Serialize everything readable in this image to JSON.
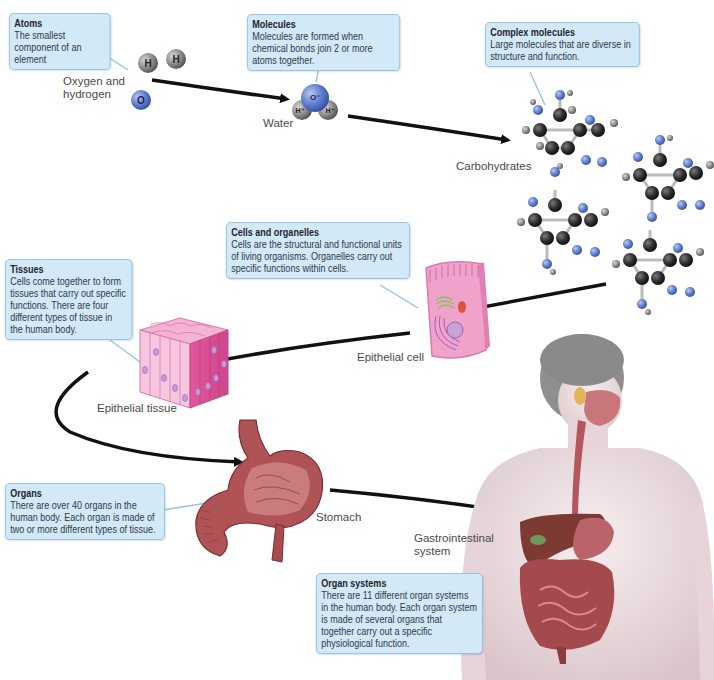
{
  "diagram": {
    "levels": [
      {
        "id": "atoms",
        "callout_title": "Atoms",
        "callout_body": "The smallest component of an element",
        "label": "Oxygen and hydrogen",
        "label_lines": [
          "Oxygen and",
          "hydrogen"
        ],
        "atom_symbols": [
          "H",
          "H",
          "O"
        ]
      },
      {
        "id": "molecules",
        "callout_title": "Molecules",
        "callout_body": "Molecules are formed when chemical bonds join 2 or more atoms together.",
        "label": "Water",
        "atom_symbols": [
          "O⁻",
          "H⁺",
          "H⁺"
        ]
      },
      {
        "id": "complex-molecules",
        "callout_title": "Complex molecules",
        "callout_body": "Large molecules that are diverse in structure and function.",
        "label": "Carbohydrates",
        "atom_symbols": [
          "C",
          "O",
          "H"
        ]
      },
      {
        "id": "cells",
        "callout_title": "Cells and organelles",
        "callout_body": "Cells are the structural and functional units of living organisms. Organelles carry out specific functions within cells.",
        "label": "Epithelial cell"
      },
      {
        "id": "tissues",
        "callout_title": "Tissues",
        "callout_body": "Cells come together to form tissues that carry out specific functions. There are four different types of tissue in the human body.",
        "label": "Epithelial tissue"
      },
      {
        "id": "organs",
        "callout_title": "Organs",
        "callout_body": "There are over 40 organs in the human body. Each organ is made of two or more different types of tissue.",
        "label": "Stomach"
      },
      {
        "id": "organ-systems",
        "callout_title": "Organ systems",
        "callout_body": "There are 11 different organ systems in the human body. Each organ system is made of several organs that together carry out a specific physiological function.",
        "label": "Gastrointestinal system",
        "label_lines": [
          "Gastrointestinal",
          "system"
        ]
      }
    ]
  },
  "colors": {
    "callout_fill": "#d3e9f7",
    "callout_border": "#8ec3e6",
    "arrow": "#111111",
    "oxygen": "#5a78c8",
    "hydrogen": "#8a8a8a",
    "carbon": "#2b2b2b",
    "cell_pink": "#f2a9cf",
    "tissue_pink": "#e86aa6",
    "stomach": "#a8454a",
    "skin": "#e9dadd"
  }
}
